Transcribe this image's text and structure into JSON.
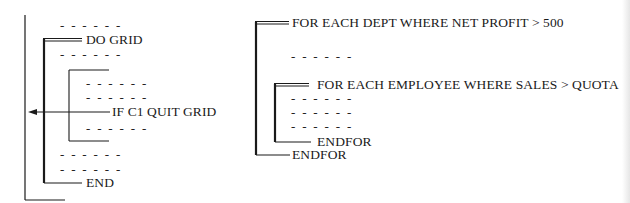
{
  "left_diagram": {
    "do_label": "DO GRID",
    "if_label": "IF C1 QUIT GRID",
    "end_label": "END",
    "dash_line": "- - - - - -"
  },
  "right_diagram": {
    "outer_for_label": "FOR EACH DEPT WHERE NET PROFIT > 500",
    "inner_for_label": "FOR EACH EMPLOYEE WHERE SALES > QUOTA",
    "inner_endfor_label": "ENDFOR",
    "outer_endfor_label": "ENDFOR",
    "dash_line": "- - - - - -"
  },
  "colors": {
    "ink": "#1a1a1a",
    "background": "#ffffff"
  }
}
